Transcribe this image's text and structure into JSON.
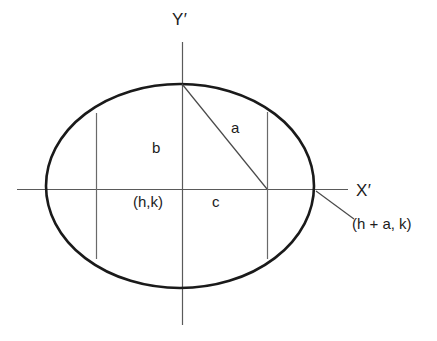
{
  "figure": {
    "kind": "ellipse-geometry-diagram",
    "background_color": "#ffffff",
    "stroke_colors": {
      "ellipse": "#1a1a1a",
      "axis": "#5a5a5a",
      "chord": "#6a6a6a",
      "leader": "#4a4a4a",
      "text": "#1c1c1c"
    },
    "stroke_widths": {
      "ellipse": 2.6,
      "axis": 1.1,
      "chord": 1.1,
      "radius": 1.1,
      "leader": 1.1
    }
  },
  "labels": {
    "y_axis": "Y′",
    "x_axis": "X′",
    "semi_minor": "b",
    "semi_major_to_focus": "a",
    "focal_distance": "c",
    "center_point": "(h,k)",
    "vertex_point": "(h + a, k)"
  },
  "geometry": {
    "center": {
      "x": 182,
      "y": 189
    },
    "ellipse": {
      "cx": 180,
      "cy": 186,
      "rx": 134,
      "ry": 102
    },
    "x_axis_line": {
      "x1": 17,
      "y1": 189,
      "x2": 348,
      "y2": 189
    },
    "y_axis_line": {
      "x1": 182,
      "y1": 42,
      "x2": 182,
      "y2": 325
    },
    "left_chord": {
      "x": 96,
      "y1": 113,
      "y2": 259
    },
    "right_chord": {
      "x": 267,
      "y1": 112,
      "y2": 259
    },
    "radius_line": {
      "x1": 182,
      "y1": 84,
      "x2": 267,
      "y2": 189
    },
    "leader_line": {
      "x1": 316,
      "y1": 191,
      "x2": 354,
      "y2": 219
    },
    "top_vertex": {
      "x": 182,
      "y": 84
    },
    "bottom_vertex": {
      "x": 182,
      "y": 288
    },
    "right_vertex": {
      "x": 314,
      "y": 189
    },
    "left_vertex": {
      "x": 46,
      "y": 189
    }
  }
}
